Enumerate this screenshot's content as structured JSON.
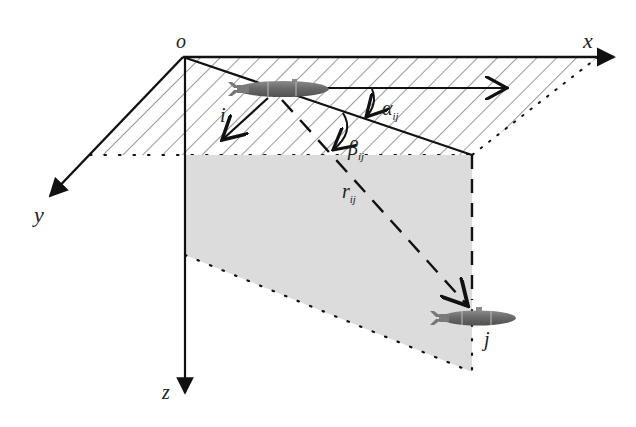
{
  "figure": {
    "type": "3d-coordinate-diagram",
    "colors": {
      "axis": "#111111",
      "hatch": "#9a9a9a",
      "vertical_plane": "#dcdcdc",
      "vehicle_body": "#6e6e6e",
      "vehicle_highlight": "#9a9a9a"
    }
  },
  "axes": {
    "origin_label": "o",
    "x_label": "x",
    "y_label": "y",
    "z_label": "z"
  },
  "vehicles": [
    {
      "id": "i",
      "label": "i"
    },
    {
      "id": "j",
      "label": "j"
    }
  ],
  "angles": {
    "alpha": {
      "symbol": "α",
      "subscript": "ij"
    },
    "beta": {
      "symbol": "β",
      "subscript": "ij"
    }
  },
  "distance": {
    "symbol": "r",
    "subscript": "ij"
  }
}
